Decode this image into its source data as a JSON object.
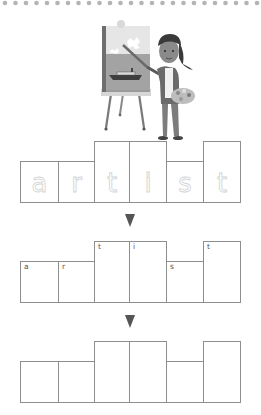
{
  "page": {
    "word": "artist",
    "border_style": "dotted-top",
    "colors": {
      "box_border": "#8e8e8e",
      "arrow": "#555555",
      "dots": "#b4b4b4",
      "trace_letters": "#d2d2d2"
    }
  },
  "illustration": {
    "subject": "girl-painting-at-easel",
    "alt": "A girl with a ponytail holding a palette paints a ship on the sea on a canvas on an easel"
  },
  "rows": [
    {
      "name": "trace-row",
      "letters": [
        {
          "trace": "a",
          "tall": false
        },
        {
          "trace": "r",
          "tall": false
        },
        {
          "trace": "t",
          "tall": true
        },
        {
          "trace": "i",
          "tall": true
        },
        {
          "trace": "s",
          "tall": false
        },
        {
          "trace": "t",
          "tall": true
        }
      ]
    },
    {
      "name": "hint-row",
      "letters": [
        {
          "hint": "a",
          "tall": false
        },
        {
          "hint": "r",
          "tall": false
        },
        {
          "hint": "t",
          "tall": true
        },
        {
          "hint": "i",
          "tall": true
        },
        {
          "hint": "s",
          "tall": false
        },
        {
          "hint": "t",
          "tall": true
        }
      ]
    },
    {
      "name": "write-row",
      "letters": [
        {
          "tall": false
        },
        {
          "tall": false
        },
        {
          "tall": true
        },
        {
          "tall": true
        },
        {
          "tall": false
        },
        {
          "tall": true
        }
      ]
    }
  ],
  "arrows": [
    {
      "icon": "down-triangle-icon"
    },
    {
      "icon": "down-triangle-icon"
    }
  ]
}
